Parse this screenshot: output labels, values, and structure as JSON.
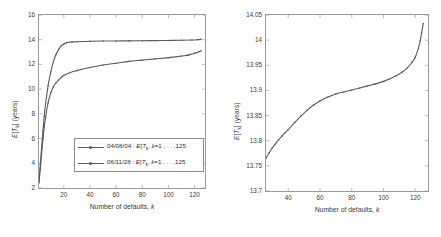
{
  "figure": {
    "panels": [
      {
        "id": "left",
        "ylabel": "E[T_k] (years)",
        "xlabel": "Number of defaults, k",
        "yticks": [
          "2",
          "4",
          "6",
          "8",
          "10",
          "12",
          "14",
          "16"
        ],
        "xticks": [
          "20",
          "40",
          "60",
          "80",
          "100",
          "120"
        ],
        "legend": [
          {
            "date": "04/08/04",
            "expr": "E[T",
            "sub": "k",
            "tail": "], k=1 , . . ,125"
          },
          {
            "date": "06/11/28",
            "expr": "E[T",
            "sub": "k",
            "tail": "], k=1 , . . ,125"
          }
        ]
      },
      {
        "id": "right",
        "ylabel": "E[T_k] (years)",
        "xlabel": "Number of defaults, k",
        "yticks": [
          "13.7",
          "13.75",
          "13.8",
          "13.85",
          "13.9",
          "13.95",
          "14",
          "14.05"
        ],
        "xticks": [
          "40",
          "60",
          "80",
          "100",
          "120"
        ],
        "legend": [
          {
            "date": "06/11/28",
            "expr": "E[T",
            "sub": "k",
            "tail": "], k=26 , . . ,125"
          }
        ]
      }
    ],
    "colors": {
      "curve": "#5a5a5a",
      "axis": "#9a9a9a",
      "text": "#3a3a3a"
    }
  },
  "chart_data": [
    {
      "type": "line",
      "title": "",
      "xlabel": "Number of defaults, k",
      "ylabel": "E[T_k] (years)",
      "xlim": [
        1,
        128
      ],
      "ylim": [
        2,
        16
      ],
      "grid": false,
      "legend_position": "center-right",
      "series": [
        {
          "name": "06/11/28 : E[T_k], k=1 , . . ,125",
          "x": [
            1,
            2,
            3,
            4,
            5,
            6,
            8,
            10,
            12,
            14,
            16,
            18,
            20,
            22,
            24,
            26,
            30,
            40,
            50,
            60,
            70,
            80,
            90,
            100,
            110,
            118,
            122,
            125
          ],
          "y": [
            2.5,
            3.9,
            5.3,
            6.6,
            7.8,
            8.8,
            10.3,
            11.4,
            12.2,
            12.8,
            13.2,
            13.5,
            13.65,
            13.75,
            13.8,
            13.82,
            13.84,
            13.87,
            13.89,
            13.9,
            13.91,
            13.92,
            13.93,
            13.94,
            13.96,
            13.98,
            14.0,
            14.03
          ]
        },
        {
          "name": "04/08/04 : E[T_k], k=1 , . . ,125",
          "x": [
            1,
            2,
            3,
            4,
            5,
            6,
            8,
            10,
            12,
            14,
            16,
            18,
            20,
            25,
            30,
            40,
            50,
            60,
            70,
            80,
            90,
            100,
            110,
            115,
            120,
            123,
            125
          ],
          "y": [
            2.4,
            3.6,
            4.8,
            5.9,
            6.9,
            7.7,
            8.9,
            9.7,
            10.2,
            10.5,
            10.75,
            10.95,
            11.1,
            11.35,
            11.5,
            11.75,
            11.95,
            12.1,
            12.25,
            12.35,
            12.45,
            12.55,
            12.68,
            12.75,
            12.9,
            13.0,
            13.1
          ]
        }
      ]
    },
    {
      "type": "line",
      "title": "",
      "xlabel": "Number of defaults, k",
      "ylabel": "E[T_k] (years)",
      "xlim": [
        26,
        128
      ],
      "ylim": [
        13.7,
        14.05
      ],
      "grid": false,
      "legend_position": "center",
      "series": [
        {
          "name": "06/11/28 : E[T_k], k=26 , . . ,125",
          "x": [
            26,
            28,
            30,
            32,
            34,
            36,
            38,
            40,
            44,
            48,
            52,
            56,
            60,
            65,
            70,
            75,
            80,
            85,
            90,
            95,
            100,
            104,
            108,
            112,
            115,
            118,
            120,
            122,
            123,
            124,
            125
          ],
          "y": [
            13.765,
            13.776,
            13.786,
            13.794,
            13.802,
            13.809,
            13.816,
            13.822,
            13.836,
            13.849,
            13.861,
            13.871,
            13.879,
            13.887,
            13.893,
            13.897,
            13.901,
            13.905,
            13.909,
            13.913,
            13.918,
            13.923,
            13.929,
            13.937,
            13.945,
            13.956,
            13.966,
            13.984,
            13.998,
            14.015,
            14.033
          ]
        }
      ]
    }
  ]
}
